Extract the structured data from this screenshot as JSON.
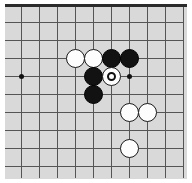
{
  "diagram": {
    "kind": "go-board-diagram",
    "board_background_color": "#d9d9d9",
    "grid_line_color": "#555555",
    "edge_line_color": "#2b2b2b",
    "page_background_color": "#ffffff",
    "black_stone_color": "#121212",
    "white_stone_color": "#fdfdfd",
    "stone_diameter": 19,
    "grid_spacing": 18,
    "board_edges_shown": [
      "top"
    ],
    "grid": {
      "vertical_lines_x": [
        3,
        21,
        39,
        57,
        75,
        93,
        111,
        129,
        147,
        165,
        183
      ],
      "horizontal_lines_y": [
        6,
        22,
        40,
        58,
        76,
        94,
        112,
        130,
        148,
        166
      ],
      "top_edge_y": 6,
      "line_extent_top": 6,
      "line_extent_bottom": 178,
      "line_extent_left": 3,
      "line_extent_right": 183
    },
    "star_points": [
      {
        "name": "star-point-left",
        "x": 21,
        "y": 76
      },
      {
        "name": "star-point-right",
        "x": 129,
        "y": 76
      }
    ],
    "stones": [
      {
        "name": "white-stone-1",
        "color": "white",
        "x": 75,
        "y": 58,
        "marked": false
      },
      {
        "name": "white-stone-2",
        "color": "white",
        "x": 93,
        "y": 58,
        "marked": false
      },
      {
        "name": "black-stone-1",
        "color": "black",
        "x": 111,
        "y": 58,
        "marked": false
      },
      {
        "name": "black-stone-2",
        "color": "black",
        "x": 129,
        "y": 58,
        "marked": false
      },
      {
        "name": "black-stone-3",
        "color": "black",
        "x": 93,
        "y": 76,
        "marked": false
      },
      {
        "name": "white-stone-marked",
        "color": "white",
        "x": 111,
        "y": 76,
        "marked": true,
        "marker": "circle"
      },
      {
        "name": "black-stone-4",
        "color": "black",
        "x": 93,
        "y": 94,
        "marked": false
      },
      {
        "name": "white-stone-3",
        "color": "white",
        "x": 129,
        "y": 112,
        "marked": false
      },
      {
        "name": "white-stone-4",
        "color": "white",
        "x": 147,
        "y": 112,
        "marked": false
      },
      {
        "name": "white-stone-5",
        "color": "white",
        "x": 129,
        "y": 148,
        "marked": false
      }
    ]
  }
}
